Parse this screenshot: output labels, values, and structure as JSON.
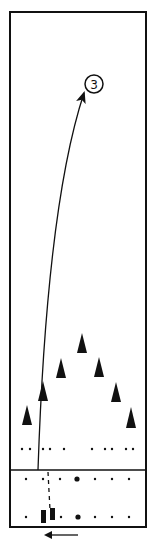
{
  "diagram": {
    "type": "drill-diagram",
    "colors": {
      "ink": "#111111",
      "background": "#ffffff"
    },
    "field": {
      "x": 10,
      "y": 12,
      "width": 136,
      "height": 515
    },
    "divider": {
      "y": 470
    },
    "target": {
      "label": "3",
      "cx": 94,
      "cy": 84,
      "r": 9
    },
    "path": {
      "solid": "M38,470 C42,350 52,190 84,93",
      "dashed": {
        "x1": 48,
        "y1": 472,
        "x2": 50,
        "y2": 510
      }
    },
    "cones": [
      {
        "cx": 27,
        "top": 405,
        "bottom": 425
      },
      {
        "cx": 43,
        "top": 381,
        "bottom": 401
      },
      {
        "cx": 61,
        "top": 358,
        "bottom": 378
      },
      {
        "cx": 82,
        "top": 333,
        "bottom": 353
      },
      {
        "cx": 99,
        "top": 357,
        "bottom": 377
      },
      {
        "cx": 116,
        "top": 382,
        "bottom": 402
      },
      {
        "cx": 131,
        "top": 407,
        "bottom": 428
      }
    ],
    "dot_rows": [
      {
        "y": 449,
        "xs": [
          22,
          30,
          43,
          50,
          64,
          92,
          105,
          112,
          126,
          133
        ],
        "large": []
      },
      {
        "y": 479,
        "xs": [
          26,
          43,
          60,
          95,
          112,
          129
        ],
        "large": [
          77
        ]
      },
      {
        "y": 517,
        "xs": [
          26,
          61,
          95,
          112,
          129
        ],
        "large": [
          78
        ]
      }
    ],
    "players": [
      {
        "x": 41,
        "y": 510,
        "w": 5,
        "h": 13
      },
      {
        "x": 50,
        "y": 508,
        "w": 5,
        "h": 12
      }
    ],
    "direction_arrow": {
      "x1": 78,
      "x2": 46,
      "y": 535,
      "direction": "left"
    }
  }
}
